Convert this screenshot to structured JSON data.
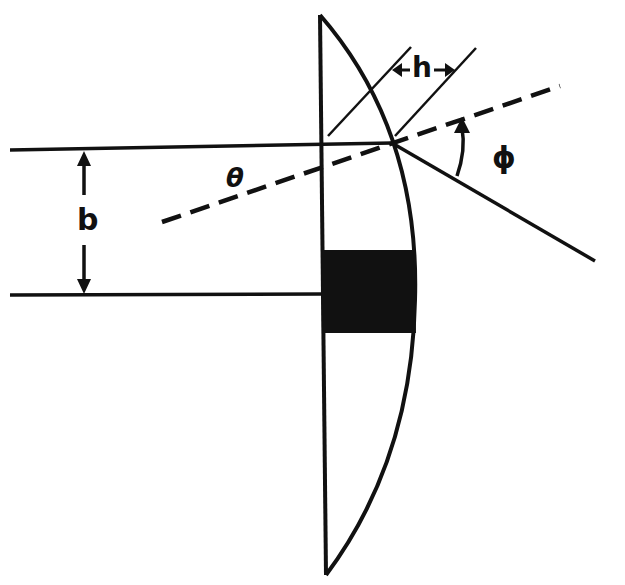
{
  "diagram": {
    "type": "optics-lens-deflection",
    "labels": {
      "b": "b",
      "h": "h",
      "theta": "θ",
      "phi": "ϕ"
    },
    "elements": [
      "plano-convex lens (flat face left, curved face right)",
      "incident ray (horizontal, top)",
      "optical axis reference line (horizontal, bottom)",
      "impact parameter b (double arrow)",
      "dashed normal line at angle θ",
      "deflected ray",
      "angle ϕ arc arrow",
      "width h between two parallel lines",
      "opaque central stop (black band)"
    ],
    "colors": {
      "ink": "#111111",
      "background": "#ffffff"
    }
  }
}
